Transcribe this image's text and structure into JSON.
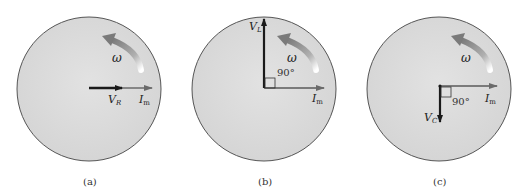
{
  "panels": [
    {
      "caption": "(a)",
      "center": [
        89,
        89
      ],
      "radius": 72,
      "omega_label": "ω",
      "vectors": [
        {
          "name": "I_m",
          "label": "I",
          "sub": "m",
          "direction": "0°"
        },
        {
          "name": "V_R",
          "label": "V",
          "sub": "R",
          "direction": "0°"
        }
      ]
    },
    {
      "caption": "(b)",
      "center": [
        264,
        89
      ],
      "radius": 72,
      "omega_label": "ω",
      "angle_label": "90°",
      "vectors": [
        {
          "name": "I_m",
          "label": "I",
          "sub": "m",
          "direction": "0°"
        },
        {
          "name": "V_L",
          "label": "V",
          "sub": "L",
          "direction": "90°"
        }
      ]
    },
    {
      "caption": "(c)",
      "center": [
        439,
        89
      ],
      "radius": 72,
      "omega_label": "ω",
      "angle_label": "90°",
      "vectors": [
        {
          "name": "I_m",
          "label": "I",
          "sub": "m",
          "direction": "0°"
        },
        {
          "name": "V_C",
          "label": "V",
          "sub": "C",
          "direction": "-90°"
        }
      ]
    }
  ],
  "colors": {
    "disk_fill": "#dcdcdc",
    "disk_edge": "#555555",
    "current_arrow": "#6a6a6a",
    "voltage_arrow": "#1a1a1a",
    "omega_arrow": "#8a8a8a"
  }
}
